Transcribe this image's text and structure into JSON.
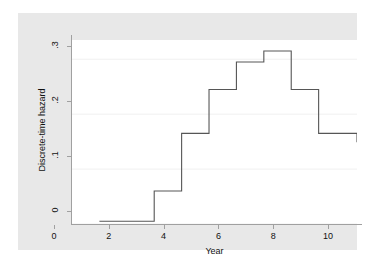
{
  "chart_data": {
    "type": "line",
    "subtype": "step",
    "title": "",
    "xlabel": "Year",
    "ylabel": "Discrete-time hazard",
    "x": [
      1,
      2,
      3,
      4,
      5,
      6,
      7,
      8,
      9,
      10
    ],
    "values": [
      0.005,
      0.005,
      0.06,
      0.165,
      0.245,
      0.295,
      0.315,
      0.245,
      0.165,
      0.165
    ],
    "series": [
      {
        "name": "Discrete-time hazard",
        "values": [
          0.005,
          0.005,
          0.06,
          0.165,
          0.245,
          0.295,
          0.315,
          0.245,
          0.165,
          0.165
        ]
      }
    ],
    "xlim": [
      0,
      10.4
    ],
    "ylim": [
      0,
      0.335
    ],
    "xticks": [
      0,
      2,
      4,
      6,
      8,
      10
    ],
    "xtick_labels": [
      "0",
      "2",
      "4",
      "6",
      "8",
      "10"
    ],
    "yticks": [
      0,
      0.1,
      0.2,
      0.3
    ],
    "ytick_labels": [
      "0",
      ".1",
      ".2",
      ".3"
    ],
    "grid": "horizontal",
    "legend": "none",
    "line_color": "#565656",
    "grid_color": "#f0f0f0",
    "axis_color": "#a0a0a0",
    "plot_background": "#ffffff",
    "graph_background": "#e8e8e8"
  }
}
